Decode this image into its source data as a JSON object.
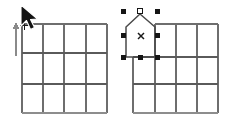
{
  "scene": {
    "title": "Two CAD grids: left grid with drawing cursor, right grid with selected pentagon object",
    "background_color": "#ffffff",
    "width": 228,
    "height": 126
  },
  "palette": {
    "grid_line": "#767676",
    "grid_line_major": "#5a5a5a",
    "shape_outline": "#4a4a4a",
    "handle_fill": "#1a1a1a",
    "handle_open_fill": "#ffffff",
    "cursor_fill": "#111111",
    "marker_color": "#1a1a1a",
    "axis_color": "#8a8a8a"
  },
  "left_panel": {
    "label": "left-grid-panel",
    "grid": {
      "name": "grid-4x3",
      "columns": 4,
      "rows": 3,
      "x": 22,
      "y": 24,
      "width": 85,
      "height": 89,
      "column_x": [
        22,
        43,
        64,
        86,
        107
      ],
      "row_y": [
        24,
        53,
        84,
        113
      ],
      "major_rows": [
        53,
        84
      ]
    },
    "cursor": {
      "name": "arrow-cursor",
      "icon": "mouse-pointer-icon",
      "tip_x": 22,
      "tip_y": 6,
      "points": "22,6 22,27 27,22 31,30 35,28 31,21 38,20"
    },
    "crosshair": {
      "name": "crosshair-icon",
      "icon": "crosshair-icon",
      "x": 24,
      "y": 25,
      "size": 7
    },
    "axis_arrow": {
      "name": "vertical-axis-arrow",
      "icon": "arrow-up-icon",
      "x": 16,
      "top_y": 24,
      "bottom_y": 56
    }
  },
  "right_panel": {
    "label": "right-grid-panel",
    "grid": {
      "name": "grid-4x3",
      "columns": 4,
      "rows": 3,
      "x": 133,
      "y": 24,
      "width": 85,
      "height": 89,
      "column_x": [
        133,
        155,
        176,
        197,
        218
      ],
      "row_y": [
        24,
        57,
        84,
        113
      ],
      "major_rows": [
        57,
        84
      ]
    },
    "shape": {
      "name": "pentagon-house-shape",
      "type": "polygon",
      "points": "126,57 126,27 140,14 155,27 155,57",
      "vertex_count": 5,
      "outline_color": "#4a4a4a"
    },
    "center_marker": {
      "name": "center-x-marker",
      "icon": "x-marker-icon",
      "x": 141,
      "y": 36,
      "size": 6,
      "glyph": "x"
    },
    "selection_handles": [
      {
        "name": "handle-top-left",
        "x": 123,
        "y": 11,
        "state": "filled"
      },
      {
        "name": "handle-top-center",
        "x": 140,
        "y": 11,
        "state": "open"
      },
      {
        "name": "handle-top-right",
        "x": 157,
        "y": 11,
        "state": "filled"
      },
      {
        "name": "handle-middle-left",
        "x": 123,
        "y": 35,
        "state": "filled"
      },
      {
        "name": "handle-middle-right",
        "x": 157,
        "y": 35,
        "state": "filled"
      },
      {
        "name": "handle-bottom-left",
        "x": 123,
        "y": 57,
        "state": "filled"
      },
      {
        "name": "handle-bottom-center",
        "x": 140,
        "y": 57,
        "state": "filled"
      },
      {
        "name": "handle-bottom-right",
        "x": 157,
        "y": 57,
        "state": "filled"
      }
    ],
    "handle_size": 5
  }
}
